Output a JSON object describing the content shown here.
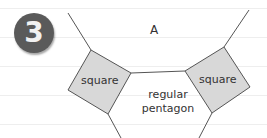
{
  "badge": {
    "number": "3"
  },
  "labels": {
    "region_a": "A",
    "left_square": "square",
    "right_square": "square",
    "pentagon_line1": "regular",
    "pentagon_line2": "pentagon"
  },
  "colors": {
    "square_fill": "#d8d8d8",
    "stroke": "#555555",
    "badge_bg": "#5a5a5a",
    "ruled_line": "#eeeeee"
  }
}
